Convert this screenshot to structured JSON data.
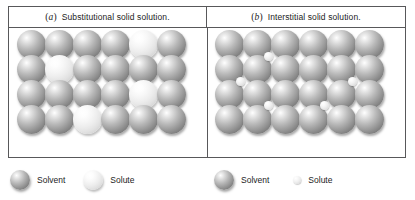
{
  "figure": {
    "panels": [
      {
        "id": "a",
        "marker": "a",
        "marker_open": "(",
        "marker_close": ")",
        "caption": "Substitutional solid solution.",
        "type": "substitutional",
        "lattice": {
          "rows": 4,
          "cols": 6,
          "sphere_diameter": 29,
          "col_spacing": 28,
          "row_spacing": 25,
          "origin_x": 8,
          "origin_y": 2,
          "solute_positions": [
            {
              "row": 1,
              "col": 5
            },
            {
              "row": 2,
              "col": 2
            },
            {
              "row": 3,
              "col": 5
            },
            {
              "row": 4,
              "col": 3
            }
          ]
        }
      },
      {
        "id": "b",
        "marker": "b",
        "marker_open": "(",
        "marker_close": ")",
        "caption": "Interstitial solid solution.",
        "type": "interstitial",
        "lattice": {
          "rows": 4,
          "cols": 6,
          "sphere_diameter": 29,
          "col_spacing": 28,
          "row_spacing": 25,
          "origin_x": 8,
          "origin_y": 2,
          "solute_positions": [],
          "interstitial_diameter": 9,
          "interstitial_positions": [
            {
              "x": 57,
              "y": 24
            },
            {
              "x": 29,
              "y": 49
            },
            {
              "x": 141,
              "y": 49
            },
            {
              "x": 57,
              "y": 73
            },
            {
              "x": 113,
              "y": 73
            }
          ]
        }
      }
    ]
  },
  "legend": {
    "groups": [
      {
        "panel": "a",
        "entries": [
          {
            "icon": "large-dark-sphere-icon",
            "label": "Solvent",
            "kind": "solvent"
          },
          {
            "icon": "large-light-sphere-icon",
            "label": "Solute",
            "kind": "solute-substitutional"
          }
        ]
      },
      {
        "panel": "b",
        "entries": [
          {
            "icon": "large-dark-sphere-icon",
            "label": "Solvent",
            "kind": "solvent"
          },
          {
            "icon": "small-light-sphere-icon",
            "label": "Solute",
            "kind": "solute-interstitial"
          }
        ]
      }
    ]
  },
  "colors": {
    "frame_border": "#58585a",
    "text": "#1c1c1c",
    "background": "#ffffff",
    "solvent_highlight": "#ffffff",
    "solvent_shadow": "#616161",
    "solute_highlight": "#ffffff",
    "solute_shadow": "#c2c2c2"
  }
}
